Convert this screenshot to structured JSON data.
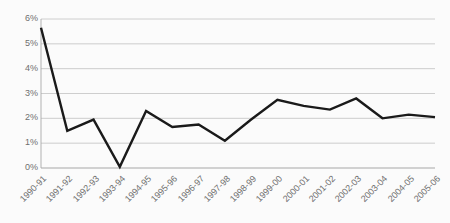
{
  "chart_data": {
    "type": "line",
    "title": "",
    "subtitle": "",
    "xlabel": "",
    "ylabel": "",
    "categories": [
      "1990-91",
      "1991-92",
      "1992-93",
      "1993-94",
      "1994-95",
      "1995-96",
      "1996-97",
      "1997-98",
      "1998-99",
      "1999-00",
      "2000-01",
      "2001-02",
      "2002-03",
      "2003-04",
      "2004-05",
      "2005-06"
    ],
    "values": [
      5.65,
      1.5,
      1.95,
      0.05,
      2.3,
      1.65,
      1.75,
      1.1,
      1.95,
      2.75,
      2.5,
      2.35,
      2.8,
      2.0,
      2.15,
      2.05
    ],
    "series": [
      {
        "name": "",
        "values": [
          5.65,
          1.5,
          1.95,
          0.05,
          2.3,
          1.65,
          1.75,
          1.1,
          1.95,
          2.75,
          2.5,
          2.35,
          2.8,
          2.0,
          2.15,
          2.05
        ]
      }
    ],
    "ylim": [
      0,
      6
    ],
    "ytick_values": [
      0,
      1,
      2,
      3,
      4,
      5,
      6
    ],
    "ytick_labels": [
      "0%",
      "1%",
      "2%",
      "3%",
      "4%",
      "5%",
      "6%"
    ],
    "grid": true,
    "grid_axis": "y",
    "legend": "none",
    "line_color": "#1a1a1a",
    "grid_color": "#c8c8c8",
    "axis_color": "#a8a8a8",
    "tick_label_color": "#6f6f6f",
    "background_color": "#fbfbfb",
    "line_width": 2.4,
    "xtick_rotation": -45
  }
}
